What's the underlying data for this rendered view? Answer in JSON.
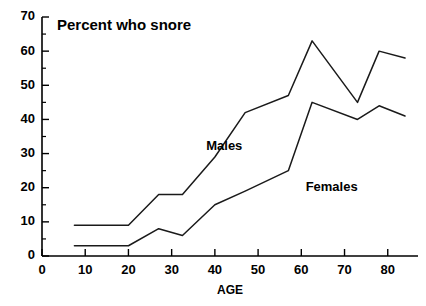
{
  "chart_data": {
    "type": "line",
    "title": "Percent who snore",
    "xlabel": "AGE",
    "ylabel": "",
    "xlim": [
      0,
      87
    ],
    "ylim": [
      0,
      70
    ],
    "xticks": [
      0,
      10,
      20,
      30,
      40,
      50,
      60,
      70,
      80
    ],
    "yticks": [
      0,
      10,
      20,
      30,
      40,
      50,
      60,
      70
    ],
    "yticks_minor": [
      5,
      15,
      25,
      35,
      45,
      55,
      65
    ],
    "grid": false,
    "legend": "inline-annotations",
    "series": [
      {
        "name": "Males",
        "label_position": {
          "x": 38,
          "y": 31
        },
        "x": [
          7.5,
          20,
          27,
          32.5,
          40,
          47,
          57,
          62.5,
          73,
          78,
          84
        ],
        "values": [
          9,
          9,
          18,
          18,
          29,
          42,
          47,
          63,
          45,
          60,
          58
        ]
      },
      {
        "name": "Females",
        "label_position": {
          "x": 61,
          "y": 19
        },
        "x": [
          7.5,
          20,
          27,
          32.5,
          40,
          47,
          57,
          62.5,
          73,
          78,
          84
        ],
        "values": [
          3,
          3,
          8,
          6,
          15,
          19,
          25,
          45,
          40,
          44,
          41
        ]
      }
    ]
  },
  "annotations": {
    "title_text": "Percent who snore",
    "males_label": "Males",
    "females_label": "Females",
    "age_axis_label": "AGE"
  }
}
